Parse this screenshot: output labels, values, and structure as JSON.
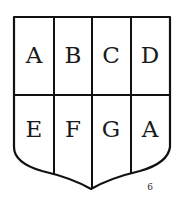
{
  "diagram": {
    "type": "heraldic-shield-partition",
    "rows": 2,
    "columns": 4,
    "cells": [
      {
        "label": "A"
      },
      {
        "label": "B"
      },
      {
        "label": "C"
      },
      {
        "label": "D"
      },
      {
        "label": "E"
      },
      {
        "label": "F"
      },
      {
        "label": "G"
      },
      {
        "label": "A"
      }
    ],
    "page_number": "6",
    "colors": {
      "stroke": "#111111",
      "fill": "#ffffff"
    }
  }
}
